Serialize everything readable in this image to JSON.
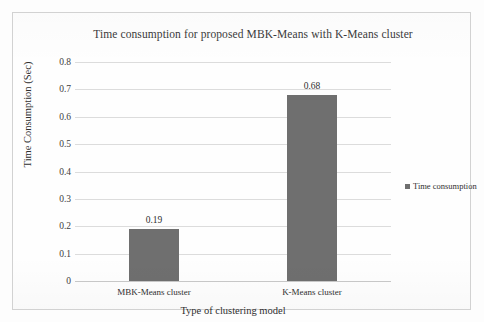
{
  "chart_data": {
    "type": "bar",
    "title": "Time consumption for proposed MBK-Means with K-Means cluster",
    "xlabel": "Type of clustering model",
    "ylabel": "Time Consumption (Sec)",
    "categories": [
      "MBK-Means cluster",
      "K-Means cluster"
    ],
    "values": [
      0.19,
      0.68
    ],
    "data_labels": [
      "0.19",
      "0.68"
    ],
    "series": [
      {
        "name": "Time consumption",
        "values": [
          0.19,
          0.68
        ],
        "color": "#6f6f6f"
      }
    ],
    "ylim": [
      0,
      0.8
    ],
    "ytick_labels": [
      "0.8",
      "0.7",
      "0.6",
      "0.5",
      "0.4",
      "0.3",
      "0.2",
      "0.1",
      "0"
    ],
    "ytick_values": [
      0.8,
      0.7,
      0.6,
      0.5,
      0.4,
      0.3,
      0.2,
      0.1,
      0
    ],
    "grid": true,
    "legend": {
      "position": "right",
      "entries": [
        "Time consumption"
      ]
    }
  },
  "legend": {
    "marker": "square-marker-icon",
    "label": "Time consumption"
  },
  "colors": {
    "bar": "#6f6f6f",
    "gridline": "#dcdcdc",
    "frame": "#d2d2d2",
    "text": "#2f2f2f"
  }
}
